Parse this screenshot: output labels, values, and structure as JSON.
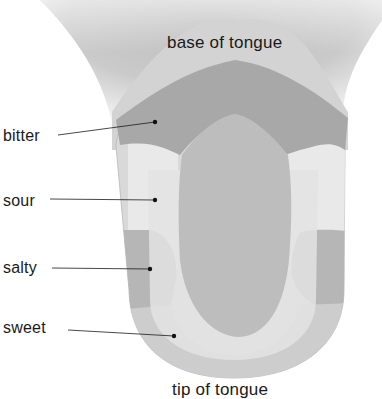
{
  "diagram": {
    "labels": {
      "base": "base of tongue",
      "tip": "tip of tongue"
    },
    "regions": [
      {
        "name": "bitter",
        "label": "bitter"
      },
      {
        "name": "sour",
        "label": "sour"
      },
      {
        "name": "salty",
        "label": "salty"
      },
      {
        "name": "sweet",
        "label": "sweet"
      }
    ],
    "colors": {
      "throat": "#c9c9c9",
      "base_band": "#d6d6d6",
      "bitter": "#a9a9a9",
      "center": "#bdbdbd",
      "sour": "#e6e6e6",
      "salty": "#b4b4b4",
      "sweet": "#cfcfcf",
      "outer_rim": "#d9d9d9",
      "leader_line": "#1a1a1a"
    }
  }
}
